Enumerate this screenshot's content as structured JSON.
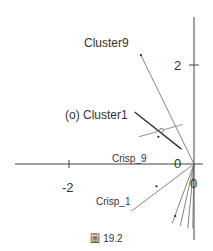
{
  "figure": {
    "caption": "圖 19.2"
  },
  "chart_data": {
    "type": "biplot",
    "title": "",
    "axes": {
      "x_tick_labels": [
        "-2",
        "0"
      ],
      "y_tick_labels": [
        "2",
        "0"
      ],
      "x_ticks": [
        -2,
        0
      ],
      "y_ticks": [
        2,
        0
      ]
    },
    "labels": {
      "cluster9": "Cluster9",
      "cluster1": "(o) Cluster1",
      "crisp9": "Crisp_9",
      "crisp1": "Crisp_1"
    },
    "vectors": [
      {
        "name": "Cluster9",
        "x": -0.85,
        "y": 2.2
      },
      {
        "name": "Crisp_1",
        "x": -1.0,
        "y": -0.95
      },
      {
        "name": "ray3",
        "x": -0.35,
        "y": -1.2
      },
      {
        "name": "ray4",
        "x": -0.22,
        "y": -1.25
      },
      {
        "name": "ray5",
        "x": -0.1,
        "y": -1.3
      },
      {
        "name": "ray6",
        "x": -0.02,
        "y": -1.3
      }
    ],
    "points": [
      {
        "name": "cluster1-marker",
        "x": -0.52,
        "y": 0.68
      },
      {
        "name": "dot-a",
        "x": -0.57,
        "y": 0.55
      },
      {
        "name": "dot-b",
        "x": -0.6,
        "y": -0.45
      },
      {
        "name": "dot-c",
        "x": -0.3,
        "y": -1.05
      }
    ],
    "cluster1_axis": {
      "segment": [
        {
          "x": -0.95,
          "y": 1.05
        },
        {
          "x": -0.2,
          "y": 0.3
        }
      ],
      "cross": [
        {
          "x": -0.88,
          "y": 0.55
        },
        {
          "x": -0.18,
          "y": 0.8
        }
      ]
    },
    "grid": false,
    "legend": "none"
  }
}
